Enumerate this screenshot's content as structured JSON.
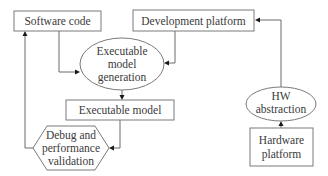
{
  "diagram": {
    "nodes": {
      "software_code": {
        "label": "Software code",
        "shape": "rectangle"
      },
      "development_platform": {
        "label": "Development platform",
        "shape": "rectangle"
      },
      "model_generation": {
        "lines": [
          "Executable",
          "model",
          "generation"
        ],
        "shape": "ellipse"
      },
      "executable_model": {
        "label": "Executable model",
        "shape": "rectangle"
      },
      "debug_validation": {
        "lines": [
          "Debug and",
          "performance",
          "validation"
        ],
        "shape": "hexagon"
      },
      "hw_abstraction": {
        "lines": [
          "HW",
          "abstraction"
        ],
        "shape": "ellipse"
      },
      "hardware_platform": {
        "lines": [
          "Hardware",
          "platform"
        ],
        "shape": "rectangle"
      }
    },
    "edges": [
      {
        "from": "software_code",
        "to": "model_generation"
      },
      {
        "from": "development_platform",
        "to": "model_generation"
      },
      {
        "from": "model_generation",
        "to": "executable_model"
      },
      {
        "from": "executable_model",
        "to": "debug_validation"
      },
      {
        "from": "debug_validation",
        "to": "software_code"
      },
      {
        "from": "hardware_platform",
        "to": "hw_abstraction"
      },
      {
        "from": "hw_abstraction",
        "to": "development_platform"
      }
    ],
    "colors": {
      "stroke": "#7a7a7a",
      "text": "#3a3a3a",
      "arrowhead": "#1a1a1a",
      "background": "#ffffff"
    }
  }
}
